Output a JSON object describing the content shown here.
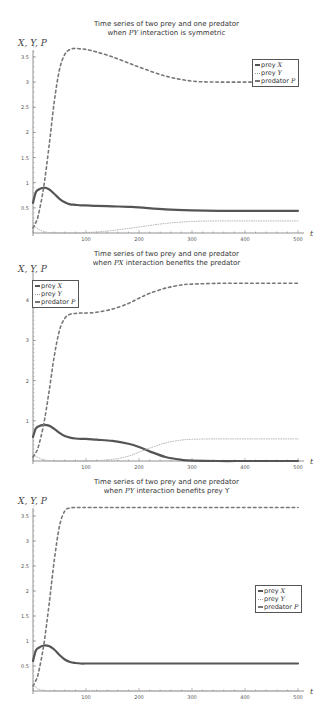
{
  "chart_data": [
    {
      "type": "line",
      "title": "Time series of two prey and one predator",
      "subtitle_pre": "when ",
      "subtitle_var": "PY",
      "subtitle_post": " interaction is symmetric",
      "xlabel": "t",
      "ylabel": "X, Y, P",
      "xlim": [
        0,
        500
      ],
      "ylim": [
        0,
        3.7
      ],
      "xticks": [
        100,
        200,
        300,
        400,
        500
      ],
      "yticks": [
        0.5,
        1,
        1.5,
        2,
        2.5,
        3,
        3.5
      ],
      "legend_position": "upper right",
      "x": [
        0,
        5,
        10,
        20,
        30,
        40,
        50,
        60,
        70,
        80,
        90,
        100,
        120,
        150,
        180,
        200,
        250,
        300,
        350,
        400,
        450,
        500
      ],
      "series": [
        {
          "name": "prey X",
          "style": "solid",
          "values": [
            0.6,
            0.8,
            0.86,
            0.9,
            0.87,
            0.78,
            0.68,
            0.61,
            0.57,
            0.56,
            0.55,
            0.55,
            0.54,
            0.53,
            0.52,
            0.51,
            0.47,
            0.45,
            0.44,
            0.44,
            0.44,
            0.44
          ]
        },
        {
          "name": "prey Y",
          "style": "dotted",
          "values": [
            0.15,
            0.12,
            0.08,
            0.03,
            0.01,
            0.0,
            0.0,
            0.0,
            0.0,
            0.0,
            0.0,
            0.01,
            0.02,
            0.05,
            0.09,
            0.12,
            0.19,
            0.23,
            0.24,
            0.24,
            0.24,
            0.24
          ]
        },
        {
          "name": "predator P",
          "style": "dashed",
          "values": [
            0.1,
            0.2,
            0.35,
            0.9,
            1.7,
            2.6,
            3.25,
            3.55,
            3.65,
            3.67,
            3.66,
            3.65,
            3.6,
            3.5,
            3.38,
            3.3,
            3.12,
            3.02,
            3.0,
            3.0,
            3.0,
            3.0
          ]
        }
      ]
    },
    {
      "type": "line",
      "title": "Time series of two prey and one predator",
      "subtitle_pre": "when ",
      "subtitle_var": "PX",
      "subtitle_post": " interaction benefits the predator",
      "xlabel": "t",
      "ylabel": "X, Y, P",
      "xlim": [
        0,
        500
      ],
      "ylim": [
        0,
        4.4
      ],
      "xticks": [
        100,
        200,
        300,
        400,
        500
      ],
      "yticks": [
        1,
        2,
        3,
        4
      ],
      "legend_position": "upper left",
      "x": [
        0,
        5,
        10,
        20,
        30,
        40,
        50,
        60,
        70,
        80,
        90,
        100,
        120,
        150,
        180,
        200,
        220,
        250,
        280,
        300,
        350,
        400,
        450,
        500
      ],
      "series": [
        {
          "name": "prey X",
          "style": "solid",
          "values": [
            0.6,
            0.8,
            0.86,
            0.9,
            0.88,
            0.8,
            0.7,
            0.62,
            0.58,
            0.56,
            0.55,
            0.55,
            0.53,
            0.5,
            0.43,
            0.35,
            0.24,
            0.1,
            0.03,
            0.01,
            0.0,
            0.0,
            0.0,
            0.0
          ]
        },
        {
          "name": "prey Y",
          "style": "dotted",
          "values": [
            0.15,
            0.12,
            0.08,
            0.03,
            0.01,
            0.0,
            0.0,
            0.0,
            0.0,
            0.0,
            0.0,
            0.0,
            0.01,
            0.04,
            0.12,
            0.22,
            0.32,
            0.45,
            0.52,
            0.54,
            0.55,
            0.55,
            0.55,
            0.55
          ]
        },
        {
          "name": "predator P",
          "style": "dashed",
          "values": [
            0.1,
            0.2,
            0.35,
            0.9,
            1.7,
            2.6,
            3.25,
            3.55,
            3.65,
            3.67,
            3.68,
            3.68,
            3.7,
            3.78,
            3.92,
            4.05,
            4.17,
            4.3,
            4.38,
            4.4,
            4.42,
            4.42,
            4.42,
            4.42
          ]
        }
      ]
    },
    {
      "type": "line",
      "title": "Time series of two prey and one predator",
      "subtitle_pre": "when ",
      "subtitle_var": "PY",
      "subtitle_post": " interaction benefits prey Y",
      "xlabel": "t",
      "ylabel": "X, Y, P",
      "xlim": [
        0,
        500
      ],
      "ylim": [
        0,
        3.7
      ],
      "xticks": [
        100,
        200,
        300,
        400,
        500
      ],
      "yticks": [
        0.5,
        1,
        1.5,
        2,
        2.5,
        3,
        3.5
      ],
      "legend_position": "center right",
      "x": [
        0,
        5,
        10,
        20,
        30,
        40,
        50,
        60,
        70,
        80,
        90,
        100,
        150,
        200,
        250,
        300,
        350,
        400,
        450,
        500
      ],
      "series": [
        {
          "name": "prey X",
          "style": "solid",
          "values": [
            0.6,
            0.8,
            0.86,
            0.91,
            0.9,
            0.83,
            0.72,
            0.63,
            0.58,
            0.56,
            0.55,
            0.55,
            0.55,
            0.55,
            0.55,
            0.55,
            0.55,
            0.55,
            0.55,
            0.55
          ]
        },
        {
          "name": "prey Y",
          "style": "dotted",
          "values": [
            0.12,
            0.08,
            0.04,
            0.01,
            0.0,
            0.0,
            0.0,
            0.0,
            0.0,
            0.0,
            0.0,
            0.0,
            0.0,
            0.0,
            0.0,
            0.0,
            0.0,
            0.0,
            0.0,
            0.0
          ]
        },
        {
          "name": "predator P",
          "style": "dashed",
          "values": [
            0.1,
            0.2,
            0.35,
            0.9,
            1.7,
            2.6,
            3.3,
            3.6,
            3.66,
            3.67,
            3.67,
            3.67,
            3.67,
            3.67,
            3.67,
            3.67,
            3.67,
            3.67,
            3.67,
            3.67
          ]
        }
      ]
    }
  ],
  "legend_labels": {
    "prey_x": "prey ",
    "prey_x_var": "X",
    "prey_y": "prey ",
    "prey_y_var": "Y",
    "predator": "predator ",
    "predator_var": "P"
  },
  "colors": {
    "line": "#555555",
    "axis": "#777777",
    "text": "#333333"
  }
}
